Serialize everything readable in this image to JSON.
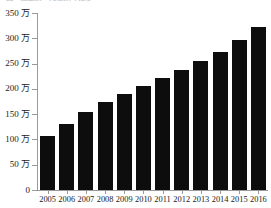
{
  "caption": {
    "text": "図1  出生数・死亡数の推移"
  },
  "chart_data": {
    "type": "bar",
    "title": "",
    "xlabel": "",
    "ylabel": "",
    "unit_suffix": "万",
    "categories": [
      "2005",
      "2006",
      "2007",
      "2008",
      "2009",
      "2010",
      "2011",
      "2012",
      "2013",
      "2014",
      "2015",
      "2016"
    ],
    "values": [
      107,
      130,
      155,
      175,
      190,
      206,
      221,
      238,
      255,
      272,
      296,
      322
    ],
    "series": [
      {
        "name": "",
        "values": [
          107,
          130,
          155,
          175,
          190,
          206,
          221,
          238,
          255,
          272,
          296,
          322
        ]
      }
    ],
    "ylim": [
      0,
      350
    ],
    "y_ticks": [
      0,
      50,
      100,
      150,
      200,
      250,
      300,
      350
    ],
    "y_tick_labels": [
      "0",
      "50 万",
      "100 万",
      "150 万",
      "200 万",
      "250 万",
      "300 万",
      "350 万"
    ],
    "grid": false,
    "legend": null,
    "bar_color": "#0d0d0d",
    "axis_color": "#9a9a9a",
    "background_color": "#ffffff"
  }
}
